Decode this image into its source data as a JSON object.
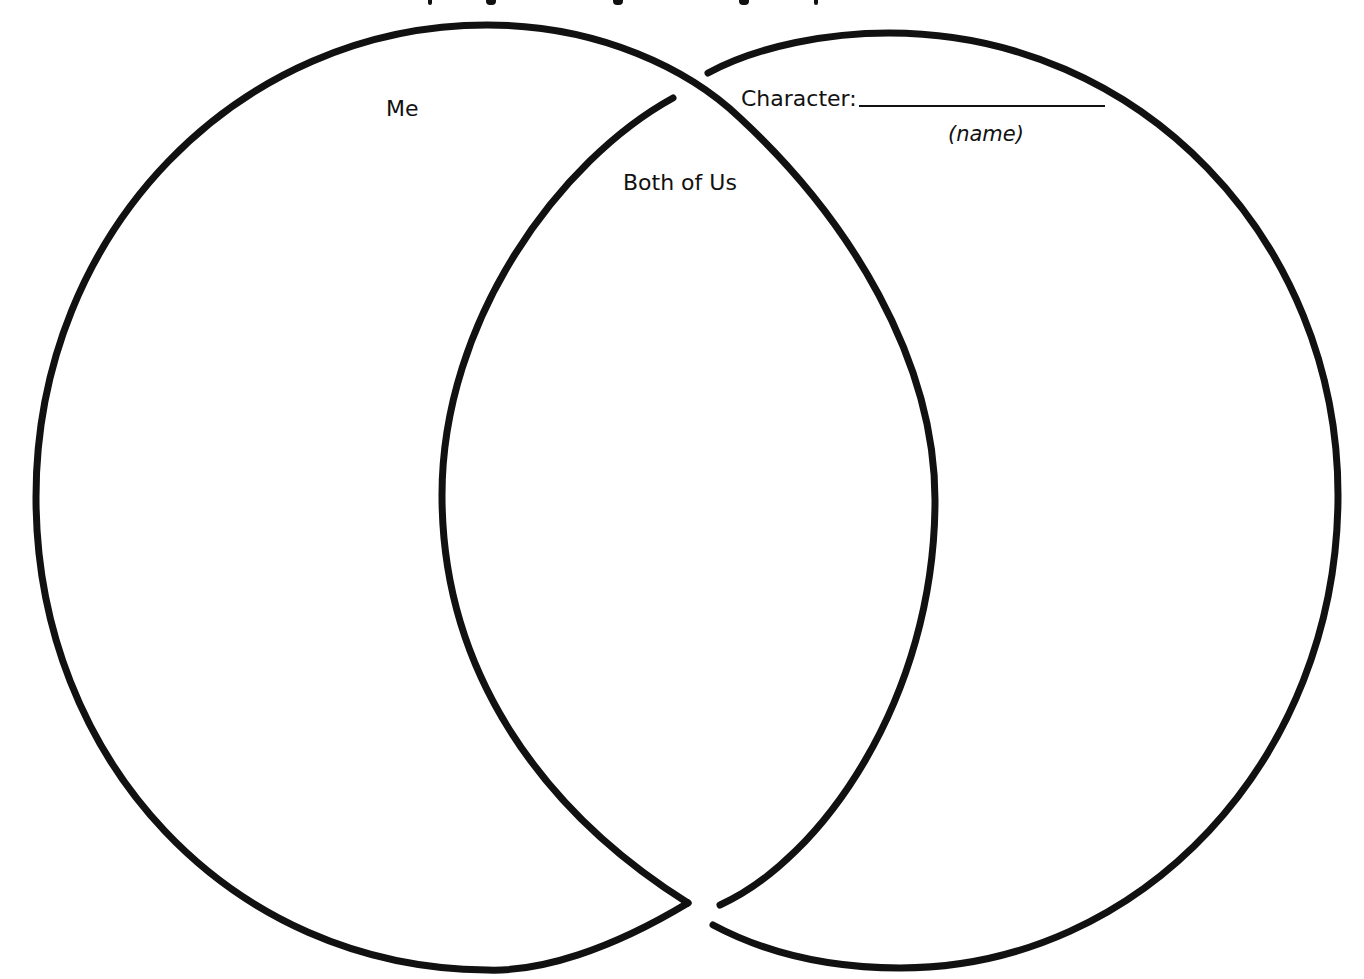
{
  "diagram": {
    "type": "venn",
    "circles": [
      {
        "id": "left",
        "label": "Me",
        "cx": 487,
        "cy": 497,
        "rx": 451,
        "ry": 472
      },
      {
        "id": "right",
        "label": "Character:",
        "sublabel": "(name)",
        "cx": 889,
        "cy": 500,
        "rx": 450,
        "ry": 468
      }
    ],
    "intersection_label": "Both of Us",
    "stroke_color": "#111111",
    "background_color": "#ffffff"
  },
  "labels": {
    "me": "Me",
    "both": "Both of Us",
    "character": "Character:",
    "name_hint": "(name)"
  },
  "inputs": {
    "character_name": {
      "value": "",
      "placeholder": ""
    }
  }
}
